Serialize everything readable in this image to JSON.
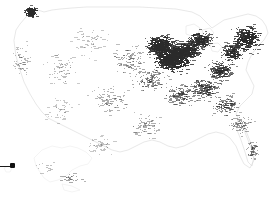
{
  "map": {
    "title": "",
    "region_name": "United States",
    "projection": "albers-usa",
    "background_color": "#ffffff",
    "outline_color": "#d9d9d9",
    "marker_color": "#2b2b2b",
    "callout_color": "#111111",
    "insets": [
      {
        "name": "alaska-inset",
        "label": ""
      },
      {
        "name": "hawaii-inset",
        "label": ""
      }
    ],
    "callout": {
      "name": "hawaii-callout",
      "label": "",
      "x": 12,
      "y": 166,
      "line_start_x": 0,
      "line_end_x": 12
    }
  },
  "chart_data": {
    "type": "scatter",
    "title": "",
    "subtitle": "",
    "xlabel": "",
    "ylabel": "",
    "legend": [],
    "grid": false,
    "projection": "albers-usa",
    "density_regions": [
      {
        "region": "Upper Midwest / Great Lakes",
        "density": "very-high"
      },
      {
        "region": "Northeast Corridor",
        "density": "high"
      },
      {
        "region": "Pacific Northwest (Seattle)",
        "density": "high"
      },
      {
        "region": "Ohio Valley",
        "density": "high"
      },
      {
        "region": "Southeast / Atlantic Coast",
        "density": "medium"
      },
      {
        "region": "Texas / Gulf Coast",
        "density": "medium-low"
      },
      {
        "region": "Mountain West",
        "density": "low"
      },
      {
        "region": "Great Plains",
        "density": "low"
      },
      {
        "region": "Alaska",
        "density": "very-low"
      },
      {
        "region": "Hawaii",
        "density": "single-point"
      }
    ],
    "clusters": [
      {
        "cx": 172,
        "cy": 58,
        "rx": 26,
        "ry": 18,
        "n": 900,
        "weight": 1.0
      },
      {
        "cx": 160,
        "cy": 45,
        "rx": 20,
        "ry": 14,
        "n": 520,
        "weight": 0.92
      },
      {
        "cx": 186,
        "cy": 50,
        "rx": 22,
        "ry": 14,
        "n": 430,
        "weight": 0.85
      },
      {
        "cx": 200,
        "cy": 40,
        "rx": 18,
        "ry": 12,
        "n": 300,
        "weight": 0.8
      },
      {
        "cx": 246,
        "cy": 38,
        "rx": 20,
        "ry": 18,
        "n": 380,
        "weight": 0.88
      },
      {
        "cx": 232,
        "cy": 52,
        "rx": 16,
        "ry": 14,
        "n": 240,
        "weight": 0.78
      },
      {
        "cx": 220,
        "cy": 70,
        "rx": 18,
        "ry": 14,
        "n": 220,
        "weight": 0.7
      },
      {
        "cx": 30,
        "cy": 12,
        "rx": 9,
        "ry": 8,
        "n": 150,
        "weight": 0.95
      },
      {
        "cx": 205,
        "cy": 88,
        "rx": 22,
        "ry": 16,
        "n": 200,
        "weight": 0.6
      },
      {
        "cx": 180,
        "cy": 95,
        "rx": 24,
        "ry": 16,
        "n": 150,
        "weight": 0.5
      },
      {
        "cx": 225,
        "cy": 105,
        "rx": 20,
        "ry": 16,
        "n": 140,
        "weight": 0.5
      },
      {
        "cx": 150,
        "cy": 80,
        "rx": 26,
        "ry": 18,
        "n": 130,
        "weight": 0.42
      },
      {
        "cx": 130,
        "cy": 60,
        "rx": 28,
        "ry": 22,
        "n": 110,
        "weight": 0.33
      },
      {
        "cx": 110,
        "cy": 100,
        "rx": 26,
        "ry": 22,
        "n": 90,
        "weight": 0.3
      },
      {
        "cx": 145,
        "cy": 125,
        "rx": 24,
        "ry": 18,
        "n": 80,
        "weight": 0.3
      },
      {
        "cx": 240,
        "cy": 125,
        "rx": 16,
        "ry": 14,
        "n": 80,
        "weight": 0.38
      },
      {
        "cx": 252,
        "cy": 150,
        "rx": 9,
        "ry": 16,
        "n": 55,
        "weight": 0.38
      },
      {
        "cx": 60,
        "cy": 70,
        "rx": 26,
        "ry": 28,
        "n": 70,
        "weight": 0.22
      },
      {
        "cx": 22,
        "cy": 60,
        "rx": 14,
        "ry": 26,
        "n": 60,
        "weight": 0.25
      },
      {
        "cx": 90,
        "cy": 40,
        "rx": 26,
        "ry": 24,
        "n": 60,
        "weight": 0.2
      },
      {
        "cx": 60,
        "cy": 110,
        "rx": 26,
        "ry": 22,
        "n": 50,
        "weight": 0.18
      },
      {
        "cx": 100,
        "cy": 145,
        "rx": 24,
        "ry": 14,
        "n": 45,
        "weight": 0.2
      },
      {
        "cx": 70,
        "cy": 178,
        "rx": 22,
        "ry": 9,
        "n": 26,
        "weight": 0.35
      },
      {
        "cx": 45,
        "cy": 168,
        "rx": 20,
        "ry": 10,
        "n": 14,
        "weight": 0.22
      }
    ]
  }
}
